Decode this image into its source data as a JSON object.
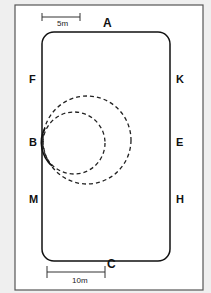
{
  "diagram": {
    "scale_bars": [
      {
        "label": "5m",
        "position": "top-left"
      },
      {
        "label": "10m",
        "position": "bottom-left"
      }
    ],
    "markers": {
      "A": "A",
      "C": "C",
      "F": "F",
      "K": "K",
      "B": "B",
      "E": "E",
      "M": "M",
      "H": "H"
    },
    "circles": [
      {
        "name": "small circle",
        "style": "dashed",
        "tangent_at": "B"
      },
      {
        "name": "large circle",
        "style": "dashed",
        "tangent_at": "B"
      }
    ],
    "colors": {
      "background": "#efefef",
      "frame": "#ffffff",
      "line": "#222222"
    }
  }
}
